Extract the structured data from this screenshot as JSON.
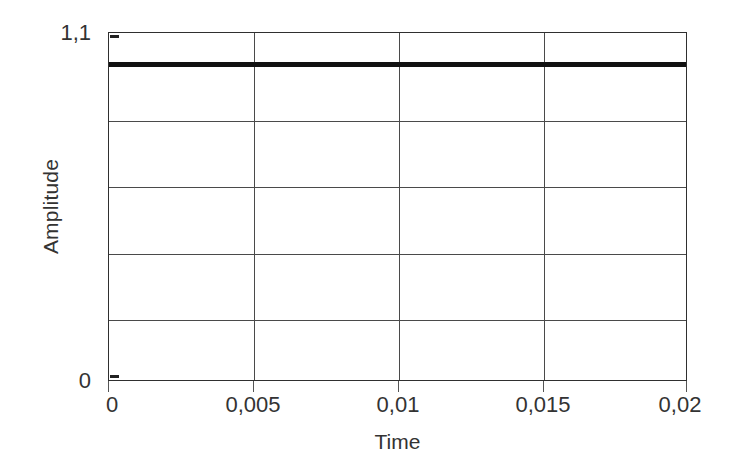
{
  "chart_data": {
    "type": "line",
    "title": "",
    "subtitle": "",
    "xlabel": "Time",
    "ylabel": "Amplitude",
    "xlim": [
      0,
      0.02
    ],
    "ylim": [
      0,
      1.1
    ],
    "grid": true,
    "legend": null,
    "decimal_separator": ",",
    "x_tick_values": [
      0,
      0.005,
      0.01,
      0.015,
      0.02
    ],
    "x_tick_labels": [
      "0",
      "0,005",
      "0,01",
      "0,015",
      "0,02"
    ],
    "y_tick_values": [
      0,
      1.1
    ],
    "y_tick_labels": [
      "0",
      "1,1"
    ],
    "y_gridline_values": [
      0.1833,
      0.3667,
      0.55,
      0.7333,
      0.9167
    ],
    "series": [
      {
        "name": "signal",
        "color": "#111111",
        "linewidth": 5,
        "constant_value": 1.0,
        "x": [
          0,
          0.005,
          0.01,
          0.015,
          0.02
        ],
        "values": [
          1.0,
          1.0,
          1.0,
          1.0,
          1.0
        ]
      }
    ]
  },
  "axes": {
    "y_title": "Amplitude",
    "x_title": "Time",
    "y_top_label": "1,1",
    "y_bottom_label": "0",
    "x_labels": [
      "0",
      "0,005",
      "0,01",
      "0,015",
      "0,02"
    ]
  },
  "colors": {
    "background": "#ffffff",
    "axis": "#2f2f2f",
    "grid": "#4a4a4a",
    "series": "#111111",
    "text": "#333333"
  }
}
